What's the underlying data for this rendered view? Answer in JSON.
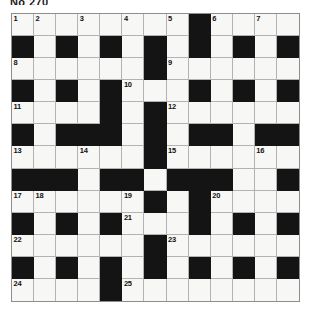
{
  "title": "No 270",
  "grid": {
    "rows": 13,
    "cols": 13,
    "black_color": "#141414",
    "white_color": "#f7f7f5",
    "grid_line_color": "#b3b3b3",
    "black_cells": [
      [
        1,
        0
      ],
      [
        1,
        2
      ],
      [
        1,
        4
      ],
      [
        1,
        6
      ],
      [
        1,
        8
      ],
      [
        1,
        10
      ],
      [
        1,
        12
      ],
      [
        0,
        8
      ],
      [
        2,
        6
      ],
      [
        3,
        0
      ],
      [
        3,
        2
      ],
      [
        3,
        4
      ],
      [
        3,
        8
      ],
      [
        3,
        10
      ],
      [
        3,
        12
      ],
      [
        4,
        4
      ],
      [
        4,
        6
      ],
      [
        5,
        0
      ],
      [
        5,
        2
      ],
      [
        5,
        3
      ],
      [
        5,
        4
      ],
      [
        5,
        6
      ],
      [
        5,
        8
      ],
      [
        5,
        9
      ],
      [
        5,
        11
      ],
      [
        5,
        12
      ],
      [
        6,
        6
      ],
      [
        7,
        0
      ],
      [
        7,
        1
      ],
      [
        7,
        2
      ],
      [
        7,
        4
      ],
      [
        7,
        5
      ],
      [
        7,
        7
      ],
      [
        7,
        8
      ],
      [
        7,
        9
      ],
      [
        7,
        12
      ],
      [
        8,
        6
      ],
      [
        8,
        8
      ],
      [
        9,
        0
      ],
      [
        9,
        2
      ],
      [
        9,
        4
      ],
      [
        9,
        8
      ],
      [
        9,
        10
      ],
      [
        9,
        12
      ],
      [
        10,
        6
      ],
      [
        11,
        0
      ],
      [
        11,
        2
      ],
      [
        11,
        4
      ],
      [
        11,
        6
      ],
      [
        11,
        8
      ],
      [
        11,
        10
      ],
      [
        11,
        12
      ],
      [
        12,
        4
      ]
    ],
    "numbers": [
      {
        "n": "1",
        "row": 0,
        "col": 0
      },
      {
        "n": "2",
        "row": 0,
        "col": 1
      },
      {
        "n": "3",
        "row": 0,
        "col": 3
      },
      {
        "n": "4",
        "row": 0,
        "col": 5
      },
      {
        "n": "5",
        "row": 0,
        "col": 7
      },
      {
        "n": "6",
        "row": 0,
        "col": 9
      },
      {
        "n": "7",
        "row": 0,
        "col": 11
      },
      {
        "n": "8",
        "row": 2,
        "col": 0
      },
      {
        "n": "9",
        "row": 2,
        "col": 7
      },
      {
        "n": "10",
        "row": 3,
        "col": 5
      },
      {
        "n": "11",
        "row": 4,
        "col": 0
      },
      {
        "n": "12",
        "row": 4,
        "col": 7
      },
      {
        "n": "13",
        "row": 6,
        "col": 0
      },
      {
        "n": "14",
        "row": 6,
        "col": 3
      },
      {
        "n": "15",
        "row": 6,
        "col": 7
      },
      {
        "n": "16",
        "row": 6,
        "col": 11
      },
      {
        "n": "17",
        "row": 8,
        "col": 0
      },
      {
        "n": "18",
        "row": 8,
        "col": 1
      },
      {
        "n": "19",
        "row": 8,
        "col": 5
      },
      {
        "n": "20",
        "row": 8,
        "col": 9
      },
      {
        "n": "21",
        "row": 9,
        "col": 5
      },
      {
        "n": "22",
        "row": 10,
        "col": 0
      },
      {
        "n": "23",
        "row": 10,
        "col": 7
      },
      {
        "n": "24",
        "row": 12,
        "col": 0
      },
      {
        "n": "25",
        "row": 12,
        "col": 5
      }
    ],
    "letters": []
  }
}
